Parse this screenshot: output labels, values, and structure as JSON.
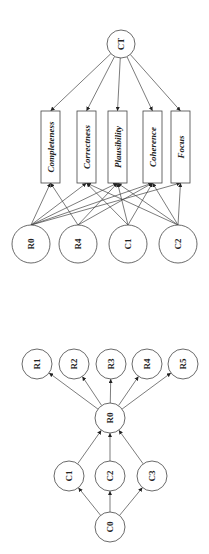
{
  "diagram_top": {
    "root": {
      "id": "CT",
      "label": "CT",
      "x": 121,
      "y": 44,
      "r": 14
    },
    "boxes": [
      {
        "id": "completeness",
        "label": "Completeness",
        "x": 41,
        "y": 111,
        "w": 19,
        "h": 72
      },
      {
        "id": "correctness",
        "label": "Correctness",
        "x": 77,
        "y": 111,
        "w": 19,
        "h": 72
      },
      {
        "id": "plausibility",
        "label": "Plausibility",
        "x": 108,
        "y": 111,
        "w": 19,
        "h": 72
      },
      {
        "id": "coherence",
        "label": "Coherence",
        "x": 143,
        "y": 111,
        "w": 19,
        "h": 72
      },
      {
        "id": "focus",
        "label": "Focus",
        "x": 171,
        "y": 111,
        "w": 19,
        "h": 72
      }
    ],
    "sources": [
      {
        "id": "R0",
        "label": "R0",
        "x": 31,
        "y": 244,
        "r": 19
      },
      {
        "id": "R4",
        "label": "R4",
        "x": 78,
        "y": 244,
        "r": 19
      },
      {
        "id": "C1",
        "label": "C1",
        "x": 128,
        "y": 244,
        "r": 19
      },
      {
        "id": "C2",
        "label": "C2",
        "x": 178,
        "y": 244,
        "r": 19
      }
    ],
    "edges_from_root": [
      "completeness",
      "correctness",
      "plausibility",
      "coherence",
      "focus"
    ],
    "edges_from_sources": [
      [
        "R0",
        "completeness"
      ],
      [
        "R0",
        "correctness"
      ],
      [
        "R0",
        "plausibility"
      ],
      [
        "R0",
        "coherence"
      ],
      [
        "R0",
        "focus"
      ],
      [
        "R4",
        "completeness"
      ],
      [
        "R4",
        "plausibility"
      ],
      [
        "R4",
        "coherence"
      ],
      [
        "C1",
        "correctness"
      ],
      [
        "C1",
        "plausibility"
      ],
      [
        "C1",
        "coherence"
      ],
      [
        "C2",
        "correctness"
      ],
      [
        "C2",
        "plausibility"
      ],
      [
        "C2",
        "coherence"
      ],
      [
        "C2",
        "focus"
      ]
    ]
  },
  "diagram_bottom": {
    "nodes": [
      {
        "id": "R1",
        "label": "R1",
        "x": 37,
        "y": 364,
        "r": 15
      },
      {
        "id": "R2",
        "label": "R2",
        "x": 74,
        "y": 364,
        "r": 15
      },
      {
        "id": "R3",
        "label": "R3",
        "x": 111,
        "y": 364,
        "r": 15
      },
      {
        "id": "R4",
        "label": "R4",
        "x": 147,
        "y": 364,
        "r": 15
      },
      {
        "id": "R5",
        "label": "R5",
        "x": 183,
        "y": 364,
        "r": 15
      },
      {
        "id": "R0",
        "label": "R0",
        "x": 110,
        "y": 418,
        "r": 15
      },
      {
        "id": "C1",
        "label": "C1",
        "x": 69,
        "y": 476,
        "r": 15
      },
      {
        "id": "C2",
        "label": "C2",
        "x": 110,
        "y": 476,
        "r": 15
      },
      {
        "id": "C3",
        "label": "C3",
        "x": 152,
        "y": 476,
        "r": 15
      },
      {
        "id": "C0",
        "label": "C0",
        "x": 110,
        "y": 527,
        "r": 15
      }
    ],
    "edges": [
      [
        "R0",
        "R1"
      ],
      [
        "R0",
        "R2"
      ],
      [
        "R0",
        "R3"
      ],
      [
        "R0",
        "R4"
      ],
      [
        "R0",
        "R5"
      ],
      [
        "C1",
        "R0"
      ],
      [
        "C2",
        "R0"
      ],
      [
        "C3",
        "R0"
      ],
      [
        "C0",
        "C1"
      ],
      [
        "C0",
        "C2"
      ],
      [
        "C0",
        "C3"
      ]
    ]
  }
}
